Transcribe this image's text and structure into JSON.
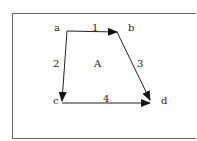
{
  "diagram": {
    "nodes": [
      {
        "id": "a",
        "label": "a"
      },
      {
        "id": "b",
        "label": "b"
      },
      {
        "id": "c",
        "label": "c"
      },
      {
        "id": "d",
        "label": "d"
      }
    ],
    "edges": [
      {
        "id": "1",
        "label": "1",
        "from": "a",
        "to": "b"
      },
      {
        "id": "2",
        "label": "2",
        "from": "a",
        "to": "c"
      },
      {
        "id": "3",
        "label": "3",
        "from": "b",
        "to": "d"
      },
      {
        "id": "4",
        "label": "4",
        "from": "c",
        "to": "d"
      }
    ],
    "region_label": "A",
    "colors": {
      "line": "#222222",
      "frame": "#666666"
    }
  }
}
